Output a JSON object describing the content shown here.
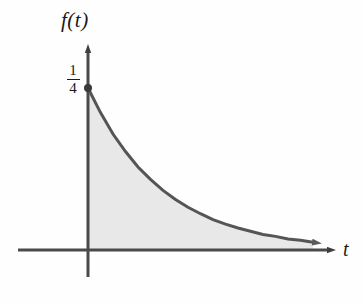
{
  "figure": {
    "title": "",
    "background_color": "#fefefe"
  },
  "axes": {
    "y_axis_label": "f(t)",
    "x_axis_label": "t",
    "axis_color": "#4a4a4a",
    "arrow_style": "solid-triangle",
    "y_axis_x_px": 88,
    "x_axis_y_px": 250,
    "y_axis_top_px": 43,
    "y_axis_bottom_px": 277,
    "x_axis_left_px": 18,
    "x_axis_right_px": 337
  },
  "ticks": {
    "y": [
      {
        "label": "1/4",
        "numerator": "1",
        "denominator": "4",
        "value": 0.25,
        "y_px": 88
      }
    ],
    "x": []
  },
  "chart_data": {
    "type": "line",
    "title": "",
    "xlabel": "t",
    "ylabel": "f(t)",
    "grid": false,
    "legend": false,
    "xlim": [
      0,
      9
    ],
    "ylim": [
      0,
      0.3
    ],
    "curve_color": "#555555",
    "fill_color": "#e8e8e8",
    "fill_under_curve": true,
    "function": "f(t) = (1/4)e^(-t/3)",
    "series": [
      {
        "name": "f(t)",
        "x": [
          0,
          0.5,
          1,
          1.5,
          2,
          2.5,
          3,
          3.5,
          4,
          4.5,
          5,
          5.5,
          6,
          6.5,
          7,
          7.5,
          8,
          8.5,
          9
        ],
        "values": [
          0.25,
          0.212,
          0.179,
          0.152,
          0.128,
          0.109,
          0.092,
          0.078,
          0.066,
          0.056,
          0.047,
          0.04,
          0.034,
          0.029,
          0.024,
          0.021,
          0.017,
          0.015,
          0.012
        ]
      }
    ],
    "markers": [
      {
        "name": "intercept-point",
        "x": 0,
        "y": 0.25,
        "label": "1/4",
        "color": "#3a3a3a",
        "radius_px": 4
      }
    ],
    "annotations": []
  }
}
